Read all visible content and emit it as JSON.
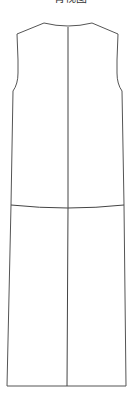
{
  "title": "背视图",
  "diagram": {
    "line_color": "#555555",
    "seam_color": "#444444",
    "background": "#ffffff",
    "elements": [
      "outline",
      "center-back-seam",
      "waist-seam",
      "hem"
    ]
  }
}
